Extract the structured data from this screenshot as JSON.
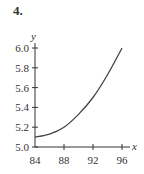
{
  "problem_number": "4.",
  "chart_data": {
    "type": "line",
    "title": "",
    "xlabel": "x",
    "ylabel": "y",
    "xlim": [
      84,
      96
    ],
    "ylim": [
      5.0,
      6.0
    ],
    "x_ticks": [
      "84",
      "88",
      "92",
      "96"
    ],
    "y_ticks": [
      "5.0",
      "5.2",
      "5.4",
      "5.6",
      "5.8",
      "6.0"
    ],
    "grid": false,
    "legend": null,
    "series": [
      {
        "name": "curve",
        "x": [
          84,
          86,
          88,
          90,
          92,
          94,
          96
        ],
        "values": [
          5.1,
          5.13,
          5.2,
          5.33,
          5.5,
          5.73,
          6.0
        ]
      }
    ]
  },
  "colors": {
    "axis": "#333333",
    "curve": "#444444"
  }
}
